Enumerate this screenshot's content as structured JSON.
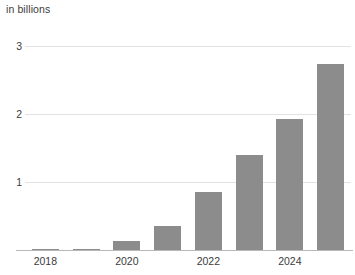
{
  "chart": {
    "subtitle": "in billions"
  },
  "chart_data": {
    "type": "bar",
    "title": "",
    "subtitle": "in billions",
    "xlabel": "",
    "ylabel": "",
    "categories": [
      "2018",
      "2019",
      "2020",
      "2021",
      "2022",
      "2023",
      "2024",
      "2025"
    ],
    "values": [
      0.01,
      0.02,
      0.13,
      0.35,
      0.85,
      1.4,
      1.92,
      2.74
    ],
    "visible_tick_labels": [
      "2018",
      "2020",
      "2022",
      "2024"
    ],
    "ytick_labels": [
      "1",
      "2",
      "3"
    ],
    "ytick_values": [
      1,
      2,
      3
    ],
    "ylim": [
      0,
      3.3
    ],
    "grid": true,
    "legend": false,
    "bar_color": "#8c8c8c",
    "gridline_color": "#e2e2e2",
    "axis_color": "#b8b8b8",
    "text_color": "#3b3b3b"
  }
}
